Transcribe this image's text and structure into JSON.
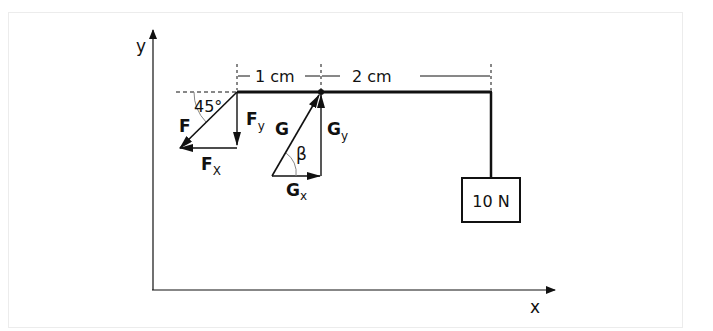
{
  "diagram": {
    "type": "statics lever / force decomposition",
    "axes": {
      "x_label": "x",
      "y_label": "y"
    },
    "dimensions": [
      {
        "label": "1 cm",
        "from": "F application point",
        "to": "pivot G"
      },
      {
        "label": "2 cm",
        "from": "pivot G",
        "to": "load hanger"
      }
    ],
    "angle_f": "45°",
    "angle_g": "β",
    "forces": {
      "F": {
        "label": "F",
        "x_component": "F",
        "x_sub": "X",
        "y_component": "F",
        "y_sub": "y"
      },
      "G": {
        "label": "G",
        "x_component": "G",
        "x_sub": "x",
        "y_component": "G",
        "y_sub": "y"
      }
    },
    "load": {
      "label": "10 N"
    },
    "colors": {
      "line": "#111111",
      "frame": "#ececec",
      "arc": "#888888"
    }
  }
}
